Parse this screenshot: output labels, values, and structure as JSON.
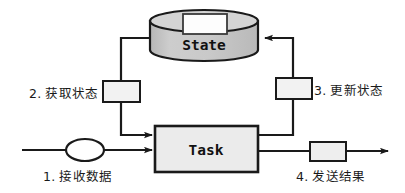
{
  "diagram": {
    "type": "flow-diagram",
    "nodes": {
      "state": {
        "label": "State",
        "shape": "cylinder",
        "fill": "#c8c8c8",
        "stroke": "#1a1a1a"
      },
      "task": {
        "label": "Task",
        "shape": "rectangle",
        "fill": "#ebebeb",
        "stroke": "#1a1a1a"
      },
      "state_top_box": {
        "label": "",
        "shape": "rectangle",
        "fill": "#fdfdfd",
        "stroke": "#3a3a3a"
      },
      "fetch_box": {
        "label": "",
        "shape": "rectangle",
        "fill": "#f2f2f2",
        "stroke": "#1a1a1a"
      },
      "update_box": {
        "label": "",
        "shape": "rectangle",
        "fill": "#f2f2f2",
        "stroke": "#1a1a1a"
      },
      "input_ellipse": {
        "label": "",
        "shape": "ellipse",
        "fill": "#ffffff",
        "stroke": "#1a1a1a"
      },
      "output_box": {
        "label": "",
        "shape": "rectangle",
        "fill": "#eeeeee",
        "stroke": "#1a1a1a"
      }
    },
    "labels": {
      "receive_data": "1. 接收数据",
      "fetch_state": "2. 获取状态",
      "update_state": "3. 更新状态",
      "send_result": "4. 发送结果"
    },
    "colors": {
      "line": "#1a1a1a",
      "state_fill": "#c8c8c8",
      "task_fill": "#ebebeb",
      "background": "#ffffff",
      "text": "#1a1a1a"
    }
  }
}
